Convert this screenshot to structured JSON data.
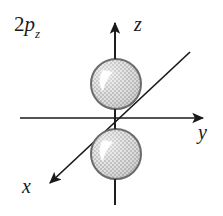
{
  "figure": {
    "orbital_label": {
      "principal_quantum_number": "2",
      "orbital_type": "p",
      "subscript": "z"
    },
    "axes": [
      {
        "name": "z",
        "label": "z",
        "direction": "up",
        "arrow": true
      },
      {
        "name": "y",
        "label": "y",
        "direction": "right",
        "arrow": true
      },
      {
        "name": "x",
        "label": "x",
        "direction": "down-left",
        "arrow": true
      }
    ],
    "lobes": [
      {
        "name": "upper-lobe",
        "position": "above-origin-on-z",
        "shape": "circle",
        "fill": "stippled-gray",
        "highlight": true
      },
      {
        "name": "lower-lobe",
        "position": "below-origin-on-z",
        "shape": "circle",
        "fill": "stippled-gray",
        "highlight": true
      }
    ],
    "colors": {
      "line": "#1a1a1a",
      "lobe_outline": "#666666",
      "lobe_fill": "#d9d9d9",
      "lobe_stipple": "#b3b3b3",
      "highlight": "#ffffff",
      "background": "#ffffff"
    }
  }
}
